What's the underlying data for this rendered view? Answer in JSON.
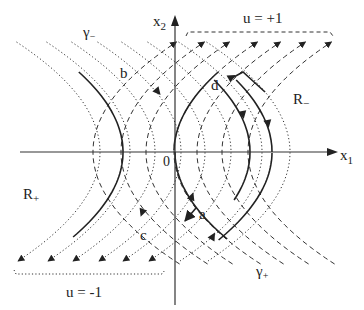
{
  "figure": {
    "axes": {
      "x_label": "x",
      "x_sub": "1",
      "y_label": "x",
      "y_sub": "2",
      "origin_label": "0"
    },
    "regions": {
      "r_minus": {
        "base": "R",
        "sub": "−"
      },
      "r_plus": {
        "base": "R",
        "sub": "+"
      }
    },
    "switching_curves": {
      "gamma_minus": {
        "base": "γ",
        "sub": "−"
      },
      "gamma_plus": {
        "base": "γ",
        "sub": "+"
      }
    },
    "controls": {
      "u_plus": "u = +1",
      "u_minus": "u = -1"
    },
    "points": {
      "a": "a",
      "b": "b",
      "c": "c",
      "d": "d"
    },
    "families": {
      "u_plus_style": "dashed",
      "u_minus_style": "dotted",
      "u_plus_flow": "upward, opening right",
      "u_minus_flow": "downward, opening left",
      "u_plus_vertex_count": 7,
      "u_minus_vertex_count": 8
    }
  }
}
